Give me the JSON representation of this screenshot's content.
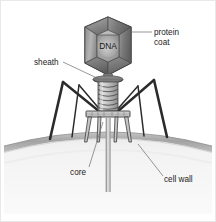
{
  "figure": {
    "background_color": "#ffffff",
    "border_color": "#e6e6e6",
    "width": 216,
    "height": 222
  },
  "labels": {
    "protein_coat_line1": "protein",
    "protein_coat_line2": "coat",
    "dna": "DNA",
    "sheath": "sheath",
    "core": "core",
    "cell_wall": "cell wall"
  },
  "colors": {
    "outline": "#2b2b2b",
    "capsid_light": "#b9b9b9",
    "capsid_mid": "#9a9a9a",
    "capsid_dark": "#6f6f6f",
    "capsid_darkest": "#585858",
    "sheath_light": "#d3d3d3",
    "sheath_mid": "#a8a8a8",
    "collar_dark": "#5a5a5a",
    "baseplate": "#c2c2c2",
    "fiber": "#2e2e2e",
    "core_tube": "#8e8e8e",
    "cell_body": "#f2f2f2",
    "cell_wall_band": "#b0b0b0",
    "leader_line": "#6b6b6b",
    "text": "#1a1a1a"
  },
  "parts": [
    {
      "name": "protein-coat",
      "description": "hexagonal capsid head enclosing DNA"
    },
    {
      "name": "dna",
      "description": "genetic material inside the head"
    },
    {
      "name": "sheath",
      "description": "contractile helical tail sheath"
    },
    {
      "name": "collar",
      "description": "neck ring between head and sheath"
    },
    {
      "name": "baseplate",
      "description": "plate at tail base bearing pins"
    },
    {
      "name": "tail-fibers",
      "description": "six jointed legs anchoring to host"
    },
    {
      "name": "core",
      "description": "hollow tube injecting DNA through the wall"
    },
    {
      "name": "cell-wall",
      "description": "bacterial outer wall band"
    },
    {
      "name": "bacterial-cell",
      "description": "host cell dome"
    }
  ]
}
